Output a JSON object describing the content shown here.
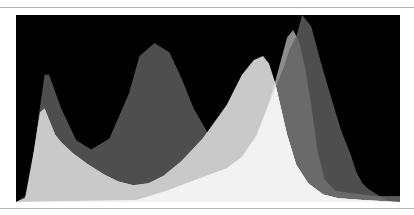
{
  "chart_data": {
    "type": "area",
    "title": "",
    "subtitle": "",
    "xlabel": "",
    "ylabel": "",
    "grid": false,
    "legend": null,
    "xlim": [
      0,
      255
    ],
    "ylim": [
      0,
      100
    ],
    "colors": {
      "background": "#000000",
      "channel_dark": "#4e4e4e",
      "channel_mid": "#8c8c8c",
      "channel_light": "#c9c9c9",
      "overlap_mid_dark": "#6a6a6a",
      "overlap_all": "#f2f2f2",
      "tail_band": "#5a5a5a"
    },
    "series": [
      {
        "name": "channel-dark",
        "x": [
          0,
          8,
          14,
          19,
          22,
          30,
          40,
          50,
          62,
          75,
          82,
          92,
          102,
          110,
          118,
          128,
          138,
          148,
          158,
          166,
          174,
          178,
          182,
          186,
          190,
          196,
          202,
          210,
          216,
          222,
          226,
          230,
          234,
          238,
          242,
          246,
          250
        ],
        "values": [
          0,
          4,
          40,
          68,
          68,
          50,
          33,
          28,
          34,
          58,
          78,
          85,
          80,
          66,
          50,
          36,
          28,
          27,
          33,
          48,
          64,
          72,
          82,
          88,
          100,
          94,
          76,
          54,
          38,
          26,
          16,
          10,
          7,
          5,
          3,
          1,
          0
        ]
      },
      {
        "name": "channel-mid",
        "x": [
          0,
          80,
          100,
          120,
          140,
          150,
          160,
          170,
          176,
          180,
          184,
          188,
          192,
          196,
          200,
          205,
          212,
          220,
          230,
          240,
          255
        ],
        "values": [
          0,
          1,
          6,
          12,
          18,
          24,
          36,
          58,
          76,
          88,
          92,
          86,
          72,
          52,
          28,
          12,
          6,
          5,
          4,
          3,
          3
        ]
      },
      {
        "name": "channel-light",
        "x": [
          0,
          6,
          12,
          16,
          19,
          22,
          26,
          30,
          38,
          48,
          58,
          68,
          78,
          88,
          98,
          110,
          124,
          140,
          150,
          158,
          164,
          168,
          172,
          176,
          180,
          186,
          194,
          204,
          214,
          230,
          255
        ],
        "values": [
          0,
          2,
          28,
          48,
          50,
          44,
          36,
          32,
          26,
          20,
          15,
          11,
          9,
          10,
          14,
          22,
          34,
          52,
          68,
          76,
          78,
          74,
          64,
          50,
          36,
          20,
          10,
          4,
          2,
          1,
          0
        ]
      }
    ]
  }
}
